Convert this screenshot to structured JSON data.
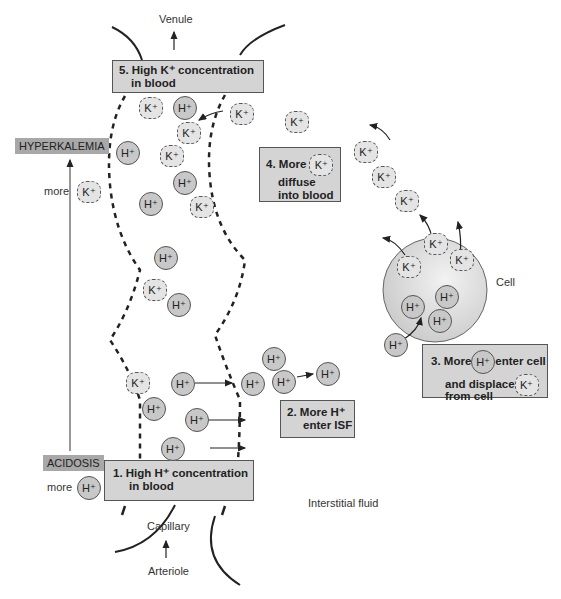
{
  "labels": {
    "venule": "Venule",
    "capillary": "Capillary",
    "arteriole": "Arteriole",
    "interstitial_fluid": "Interstitial fluid",
    "cell": "Cell",
    "more_top": "more",
    "more_bottom": "more"
  },
  "tags": {
    "hyperkalemia": "HYPERKALEMIA",
    "acidosis": "ACIDOSIS"
  },
  "steps": [
    {
      "number": "1.",
      "line1": "High H⁺ concentration",
      "line2": "in blood"
    },
    {
      "number": "2.",
      "line1": "More H⁺",
      "line2": "enter ISF"
    },
    {
      "number": "3.",
      "line1a": "More",
      "line1b": "enter cell",
      "line2": "and displace",
      "line3": "from cell"
    },
    {
      "number": "4.",
      "line1": "More",
      "line2": "diffuse",
      "line3": "into blood"
    },
    {
      "number": "5.",
      "line1": "High K⁺ concentration",
      "line2": "in blood"
    }
  ],
  "ions": {
    "h": "H⁺",
    "k": "K⁺"
  },
  "colors": {
    "box_fill": "#d4d4d4",
    "tag_fill": "#a8a8a8",
    "h_ion_fill": "#c8c8c8",
    "k_ion_fill": "#e4e4e4",
    "cell_fill": "#d8d8d8"
  }
}
